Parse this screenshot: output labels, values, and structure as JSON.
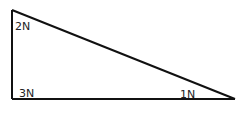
{
  "diagram": {
    "type": "right-triangle",
    "stroke_color": "#111111",
    "background": "#ffffff",
    "vertices": {
      "top_left": {
        "x": 12,
        "y": 10,
        "label": "2N"
      },
      "bottom_left": {
        "x": 12,
        "y": 99,
        "label": "3N"
      },
      "bottom_right": {
        "x": 235,
        "y": 99,
        "label": "1N"
      }
    },
    "labels": [
      {
        "id": "top-left",
        "text": "2N",
        "x": 15,
        "y": 30
      },
      {
        "id": "bottom-left",
        "text": "3N",
        "x": 19,
        "y": 97
      },
      {
        "id": "bottom-right",
        "text": "1N",
        "x": 180,
        "y": 98
      }
    ]
  }
}
